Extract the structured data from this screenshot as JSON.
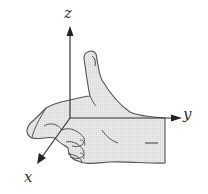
{
  "diagram": {
    "type": "right-hand-rule",
    "axes": {
      "z": {
        "label": "z"
      },
      "y": {
        "label": "y"
      },
      "x": {
        "label": "x"
      }
    },
    "colors": {
      "hand_fill": "#e6e6e6",
      "hand_outline": "#555555",
      "axis": "#333333",
      "background": "#ffffff"
    }
  }
}
